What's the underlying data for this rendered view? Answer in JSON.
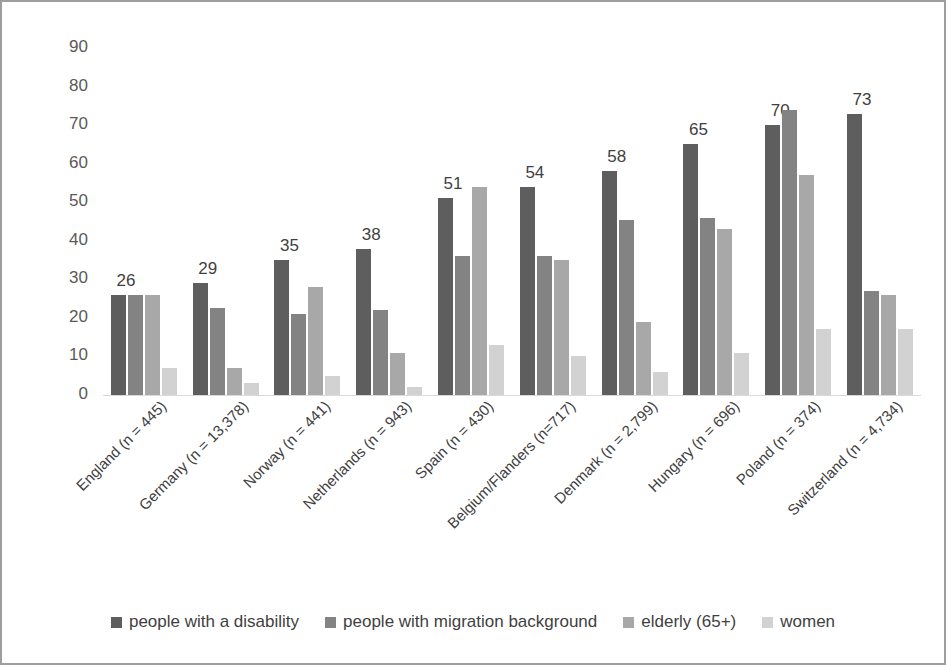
{
  "chart_data": {
    "type": "bar",
    "title": "",
    "subtitle": "",
    "xlabel": "",
    "ylabel": "",
    "ylim": [
      0,
      90
    ],
    "ytick_step": 10,
    "yticks": [
      "90",
      "80",
      "70",
      "60",
      "50",
      "40",
      "30",
      "20",
      "10",
      "0"
    ],
    "grid": false,
    "legend_position": "bottom",
    "categories": [
      "England (n = 445)",
      "Germany (n = 13,378)",
      "Norway (n = 441)",
      "Netherlands (n = 943)",
      "Spain (n = 430)",
      "Belgium/Flanders (n=717)",
      "Denmark (n = 2,799)",
      "Hungary (n = 696)",
      "Poland (n = 374)",
      "Switzerland (n = 4,734)"
    ],
    "series": [
      {
        "name": "people with a disability",
        "color": "#5e5e5e",
        "values": [
          26,
          29,
          35,
          38,
          51,
          54,
          58,
          65,
          70,
          73
        ]
      },
      {
        "name": "people with migration background",
        "color": "#838383",
        "values": [
          26,
          22.5,
          21,
          22,
          36,
          36,
          45.5,
          46,
          74,
          27
        ]
      },
      {
        "name": "elderly (65+)",
        "color": "#a8a8a8",
        "values": [
          26,
          7,
          28,
          11,
          54,
          35,
          19,
          43,
          57,
          26
        ]
      },
      {
        "name": "women",
        "color": "#d2d2d2",
        "values": [
          7,
          3,
          5,
          2,
          13,
          10,
          6,
          11,
          17,
          17
        ]
      }
    ],
    "data_labels": {
      "series": "people with a disability",
      "values": [
        "26",
        "29",
        "35",
        "38",
        "51",
        "54",
        "58",
        "65",
        "70",
        "73"
      ]
    },
    "annotations": []
  },
  "legend": {
    "items": [
      {
        "label": "people with a disability",
        "color": "#5e5e5e"
      },
      {
        "label": "people with migration background",
        "color": "#838383"
      },
      {
        "label": "elderly (65+)",
        "color": "#a8a8a8"
      },
      {
        "label": "women",
        "color": "#d2d2d2"
      }
    ]
  }
}
